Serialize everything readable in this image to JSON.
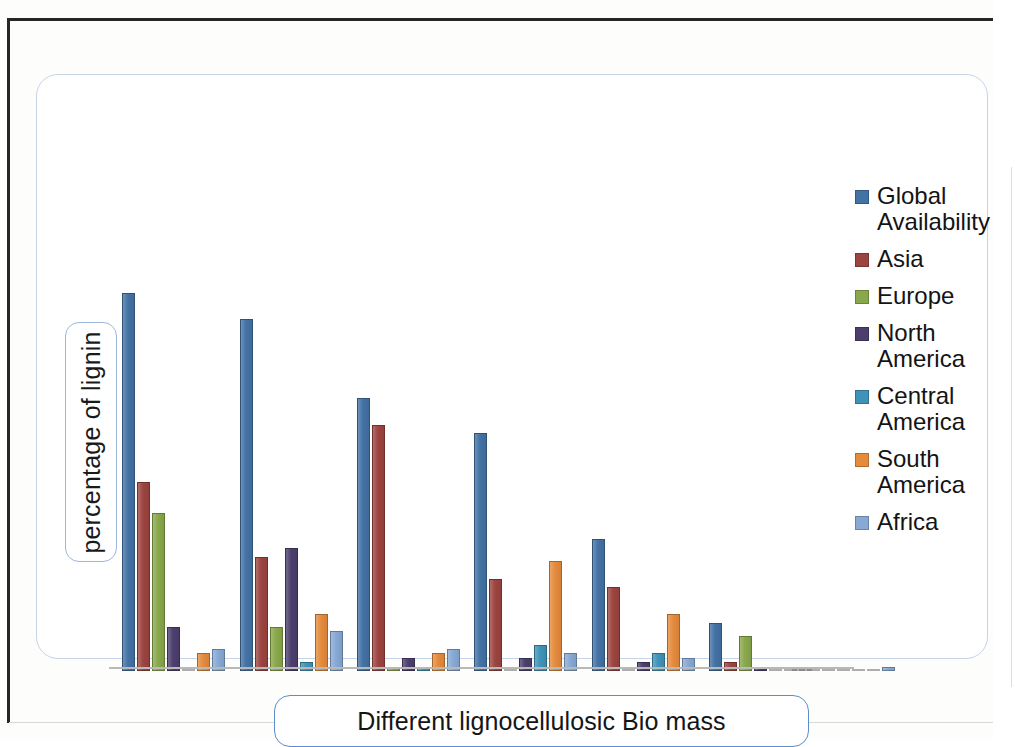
{
  "axes": {
    "y_title": "percentage of lignin",
    "x_title": "Different lignocellulosic Bio mass"
  },
  "legend": {
    "position": "right",
    "items": [
      {
        "label": "Global Availability",
        "color": "#4372a4"
      },
      {
        "label": "Asia",
        "color": "#9c4440"
      },
      {
        "label": "Europe",
        "color": "#89a84b"
      },
      {
        "label": "North America",
        "color": "#4c3f6e"
      },
      {
        "label": "Central America",
        "color": "#3f93b8"
      },
      {
        "label": "South America",
        "color": "#e58b3c"
      },
      {
        "label": "Africa",
        "color": "#87a9d4"
      }
    ]
  },
  "chart_data": {
    "type": "bar",
    "title": "",
    "xlabel": "Different lignocellulosic Bio mass",
    "ylabel": "percentage of lignin",
    "grid": false,
    "legend_position": "right",
    "ylim": [
      0,
      100
    ],
    "categories": [
      "Group 1",
      "Group 2",
      "Group 3",
      "Group 4",
      "Group 5",
      "Group 6",
      "Group 7"
    ],
    "series": [
      {
        "name": "Global Availability",
        "color": "#4372a4",
        "values": [
          86,
          80,
          62,
          54,
          30,
          11,
          0
        ]
      },
      {
        "name": "Asia",
        "color": "#9c4440",
        "values": [
          43,
          26,
          56,
          21,
          19,
          2,
          0
        ]
      },
      {
        "name": "Europe",
        "color": "#89a84b",
        "values": [
          36,
          10,
          1,
          0,
          0,
          8,
          0
        ]
      },
      {
        "name": "North America",
        "color": "#4c3f6e",
        "values": [
          10,
          28,
          3,
          3,
          2,
          1,
          0
        ]
      },
      {
        "name": "Central America",
        "color": "#3f93b8",
        "values": [
          0,
          2,
          1,
          6,
          4,
          0,
          0
        ]
      },
      {
        "name": "South America",
        "color": "#e58b3c",
        "values": [
          4,
          13,
          4,
          25,
          13,
          0,
          0
        ]
      },
      {
        "name": "Africa",
        "color": "#87a9d4",
        "values": [
          5,
          9,
          5,
          4,
          3,
          0,
          1
        ]
      }
    ],
    "group_x_px": [
      85,
      203,
      320,
      437,
      555,
      672,
      755
    ],
    "max_px": 440
  }
}
